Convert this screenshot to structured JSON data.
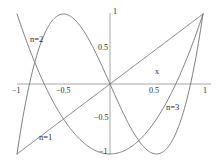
{
  "chart_data": {
    "type": "line",
    "title": "",
    "xlabel": "x",
    "ylabel": "",
    "xlim": [
      -1,
      1
    ],
    "ylim": [
      -1,
      1
    ],
    "grid": false,
    "legend_position": "inline-annotations",
    "x_ticks": [
      {
        "value": -1,
        "label": "−1"
      },
      {
        "value": -0.5,
        "label": "−0.5"
      },
      {
        "value": 0.5,
        "label": "0.5"
      },
      {
        "value": 1,
        "label": "1"
      }
    ],
    "y_ticks": [
      {
        "value": 1,
        "label": "1"
      },
      {
        "value": 0.5,
        "label": "0.5"
      },
      {
        "value": -0.5,
        "label": "−0.5"
      },
      {
        "value": -1,
        "label": "−1"
      }
    ],
    "series": [
      {
        "name": "n=1",
        "label": "n=1",
        "color": "#808080",
        "expression": "x",
        "x": [
          -1,
          -0.9,
          -0.8,
          -0.7,
          -0.6,
          -0.5,
          -0.4,
          -0.3,
          -0.2,
          -0.1,
          0,
          0.1,
          0.2,
          0.3,
          0.4,
          0.5,
          0.6,
          0.7,
          0.8,
          0.9,
          1
        ],
        "values": [
          -1,
          -0.9,
          -0.8,
          -0.7,
          -0.6,
          -0.5,
          -0.4,
          -0.3,
          -0.2,
          -0.1,
          0,
          0.1,
          0.2,
          0.3,
          0.4,
          0.5,
          0.6,
          0.7,
          0.8,
          0.9,
          1
        ]
      },
      {
        "name": "n=2",
        "label": "n=2",
        "color": "#808080",
        "expression": "2x^2 - 1",
        "x": [
          -1,
          -0.9,
          -0.8,
          -0.7,
          -0.6,
          -0.5,
          -0.4,
          -0.3,
          -0.2,
          -0.1,
          0,
          0.1,
          0.2,
          0.3,
          0.4,
          0.5,
          0.6,
          0.7,
          0.8,
          0.9,
          1
        ],
        "values": [
          1,
          0.62,
          0.28,
          -0.02,
          -0.28,
          -0.5,
          -0.68,
          -0.82,
          -0.92,
          -0.98,
          -1,
          -0.98,
          -0.92,
          -0.82,
          -0.68,
          -0.5,
          -0.28,
          -0.02,
          0.28,
          0.62,
          1
        ]
      },
      {
        "name": "n=3",
        "label": "n=3",
        "color": "#808080",
        "expression": "4x^3 - 3x",
        "x": [
          -1,
          -0.9,
          -0.8,
          -0.7,
          -0.6,
          -0.5,
          -0.4,
          -0.3,
          -0.2,
          -0.1,
          0,
          0.1,
          0.2,
          0.3,
          0.4,
          0.5,
          0.6,
          0.7,
          0.8,
          0.9,
          1
        ],
        "values": [
          -1,
          -0.216,
          0.352,
          0.728,
          0.936,
          1.0,
          0.944,
          0.792,
          0.568,
          0.296,
          0,
          -0.296,
          -0.568,
          -0.792,
          -0.944,
          -1.0,
          -0.936,
          -0.728,
          -0.352,
          0.216,
          1
        ]
      }
    ],
    "annotations": [
      {
        "text": "n=2",
        "x": -0.62,
        "y": 0.62
      },
      {
        "text": "n=1",
        "x": -0.56,
        "y": -0.79
      },
      {
        "text": "n=3",
        "x": 0.58,
        "y": -0.35
      },
      {
        "text": "x",
        "x": 0.4,
        "y": 0.13
      }
    ],
    "axis_color": "#a6a6a6",
    "curve_color": "#8c8c8c",
    "background": "#ffffff"
  }
}
